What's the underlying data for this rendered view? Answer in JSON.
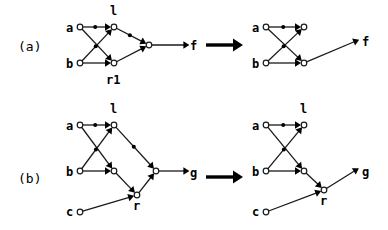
{
  "figure": {
    "title": "",
    "background_color": "#ffffff",
    "ink_color": "#000000",
    "width": 388,
    "height": 230
  },
  "rows": [
    {
      "id": "row-a",
      "label": "(a)",
      "label_pos": {
        "x": 18,
        "y": 51
      },
      "transform_arrow": {
        "from": {
          "x": 206,
          "y": 45
        },
        "to": {
          "x": 243,
          "y": 45
        },
        "style": "thick-right-arrow"
      },
      "left_graph": {
        "id": "graph-a-before",
        "nodes": [
          {
            "id": "a",
            "label": "a",
            "label_pos": {
              "x": 66,
              "y": 32
            },
            "x": 80,
            "y": 27,
            "kind": "open-circle"
          },
          {
            "id": "b",
            "label": "b",
            "label_pos": {
              "x": 66,
              "y": 68
            },
            "x": 80,
            "y": 63,
            "kind": "open-circle"
          },
          {
            "id": "l",
            "label": "l",
            "label_pos": {
              "x": 110,
              "y": 15
            },
            "x": 114,
            "y": 27,
            "kind": "open-circle"
          },
          {
            "id": "r1",
            "label": "r1",
            "label_pos": {
              "x": 106,
              "y": 84
            },
            "x": 114,
            "y": 63,
            "kind": "open-circle"
          },
          {
            "id": "out",
            "label": "",
            "label_pos": null,
            "x": 149,
            "y": 45,
            "kind": "open-circle"
          },
          {
            "id": "f",
            "label": "f",
            "label_pos": {
              "x": 190,
              "y": 50
            },
            "x": 186,
            "y": 45,
            "kind": "terminal"
          }
        ],
        "edges": [
          {
            "from": "a",
            "to": "l",
            "inverter": true,
            "arrow": true
          },
          {
            "from": "a",
            "to": "r1",
            "inverter": false,
            "arrow": true
          },
          {
            "from": "b",
            "to": "l",
            "inverter": true,
            "arrow": true
          },
          {
            "from": "b",
            "to": "r1",
            "inverter": false,
            "arrow": true
          },
          {
            "from": "l",
            "to": "out",
            "inverter": true,
            "arrow": true
          },
          {
            "from": "r1",
            "to": "out",
            "inverter": false,
            "arrow": true
          },
          {
            "from": "out",
            "to": "f",
            "inverter": false,
            "arrow": true
          }
        ]
      },
      "right_graph": {
        "id": "graph-a-after",
        "nodes": [
          {
            "id": "a",
            "label": "a",
            "label_pos": {
              "x": 252,
              "y": 32
            },
            "x": 266,
            "y": 27,
            "kind": "open-circle"
          },
          {
            "id": "b",
            "label": "b",
            "label_pos": {
              "x": 252,
              "y": 68
            },
            "x": 266,
            "y": 63,
            "kind": "open-circle"
          },
          {
            "id": "l",
            "label": "",
            "label_pos": null,
            "x": 304,
            "y": 27,
            "kind": "open-circle"
          },
          {
            "id": "r",
            "label": "",
            "label_pos": null,
            "x": 304,
            "y": 63,
            "kind": "open-circle"
          },
          {
            "id": "f",
            "label": "f",
            "label_pos": {
              "x": 362,
              "y": 46
            },
            "x": 356,
            "y": 41,
            "kind": "terminal"
          }
        ],
        "edges": [
          {
            "from": "a",
            "to": "l",
            "inverter": true,
            "arrow": true
          },
          {
            "from": "a",
            "to": "r",
            "inverter": false,
            "arrow": true
          },
          {
            "from": "b",
            "to": "l",
            "inverter": true,
            "arrow": true
          },
          {
            "from": "b",
            "to": "r",
            "inverter": false,
            "arrow": true
          },
          {
            "from": "r",
            "to": "f",
            "inverter": false,
            "arrow": true
          }
        ]
      }
    },
    {
      "id": "row-b",
      "label": "(b)",
      "label_pos": {
        "x": 18,
        "y": 183
      },
      "transform_arrow": {
        "from": {
          "x": 206,
          "y": 177
        },
        "to": {
          "x": 243,
          "y": 177
        },
        "style": "thick-right-arrow"
      },
      "left_graph": {
        "id": "graph-b-before",
        "nodes": [
          {
            "id": "a",
            "label": "a",
            "label_pos": {
              "x": 66,
              "y": 130
            },
            "x": 80,
            "y": 125,
            "kind": "open-circle"
          },
          {
            "id": "b",
            "label": "b",
            "label_pos": {
              "x": 66,
              "y": 176
            },
            "x": 80,
            "y": 171,
            "kind": "open-circle"
          },
          {
            "id": "c",
            "label": "c",
            "label_pos": {
              "x": 66,
              "y": 216
            },
            "x": 80,
            "y": 212,
            "kind": "open-circle"
          },
          {
            "id": "l",
            "label": "l",
            "label_pos": {
              "x": 110,
              "y": 113
            },
            "x": 114,
            "y": 125,
            "kind": "open-circle"
          },
          {
            "id": "mid",
            "label": "",
            "label_pos": null,
            "x": 114,
            "y": 171,
            "kind": "open-circle"
          },
          {
            "id": "r",
            "label": "r",
            "label_pos": {
              "x": 133,
              "y": 210
            },
            "x": 137,
            "y": 195,
            "kind": "open-circle"
          },
          {
            "id": "out",
            "label": "",
            "label_pos": null,
            "x": 156,
            "y": 171,
            "kind": "open-circle"
          },
          {
            "id": "g",
            "label": "g",
            "label_pos": {
              "x": 190,
              "y": 177
            },
            "x": 186,
            "y": 171,
            "kind": "terminal"
          }
        ],
        "edges": [
          {
            "from": "a",
            "to": "l",
            "inverter": true,
            "arrow": true
          },
          {
            "from": "a",
            "to": "mid",
            "inverter": false,
            "arrow": true
          },
          {
            "from": "b",
            "to": "l",
            "inverter": true,
            "arrow": true
          },
          {
            "from": "b",
            "to": "mid",
            "inverter": false,
            "arrow": true
          },
          {
            "from": "l",
            "to": "out",
            "inverter": true,
            "arrow": true
          },
          {
            "from": "mid",
            "to": "r",
            "inverter": false,
            "arrow": true
          },
          {
            "from": "c",
            "to": "r",
            "inverter": false,
            "arrow": true
          },
          {
            "from": "r",
            "to": "out",
            "inverter": false,
            "arrow": true
          },
          {
            "from": "out",
            "to": "g",
            "inverter": false,
            "arrow": true
          }
        ]
      },
      "right_graph": {
        "id": "graph-b-after",
        "nodes": [
          {
            "id": "a",
            "label": "a",
            "label_pos": {
              "x": 252,
              "y": 130
            },
            "x": 266,
            "y": 125,
            "kind": "open-circle"
          },
          {
            "id": "b",
            "label": "b",
            "label_pos": {
              "x": 252,
              "y": 176
            },
            "x": 266,
            "y": 171,
            "kind": "open-circle"
          },
          {
            "id": "c",
            "label": "c",
            "label_pos": {
              "x": 252,
              "y": 216
            },
            "x": 266,
            "y": 212,
            "kind": "open-circle"
          },
          {
            "id": "l",
            "label": "l",
            "label_pos": {
              "x": 300,
              "y": 113
            },
            "x": 304,
            "y": 125,
            "kind": "open-circle"
          },
          {
            "id": "mid",
            "label": "",
            "label_pos": null,
            "x": 304,
            "y": 171,
            "kind": "open-circle"
          },
          {
            "id": "r",
            "label": "r",
            "label_pos": {
              "x": 320,
              "y": 205
            },
            "x": 324,
            "y": 190,
            "kind": "open-circle"
          },
          {
            "id": "g",
            "label": "g",
            "label_pos": {
              "x": 362,
              "y": 176
            },
            "x": 356,
            "y": 170,
            "kind": "terminal"
          }
        ],
        "edges": [
          {
            "from": "a",
            "to": "l",
            "inverter": true,
            "arrow": true
          },
          {
            "from": "a",
            "to": "mid",
            "inverter": false,
            "arrow": true
          },
          {
            "from": "b",
            "to": "l",
            "inverter": true,
            "arrow": true
          },
          {
            "from": "b",
            "to": "mid",
            "inverter": false,
            "arrow": true
          },
          {
            "from": "mid",
            "to": "r",
            "inverter": false,
            "arrow": true
          },
          {
            "from": "c",
            "to": "r",
            "inverter": false,
            "arrow": true
          },
          {
            "from": "r",
            "to": "g",
            "inverter": false,
            "arrow": true
          }
        ]
      }
    }
  ]
}
